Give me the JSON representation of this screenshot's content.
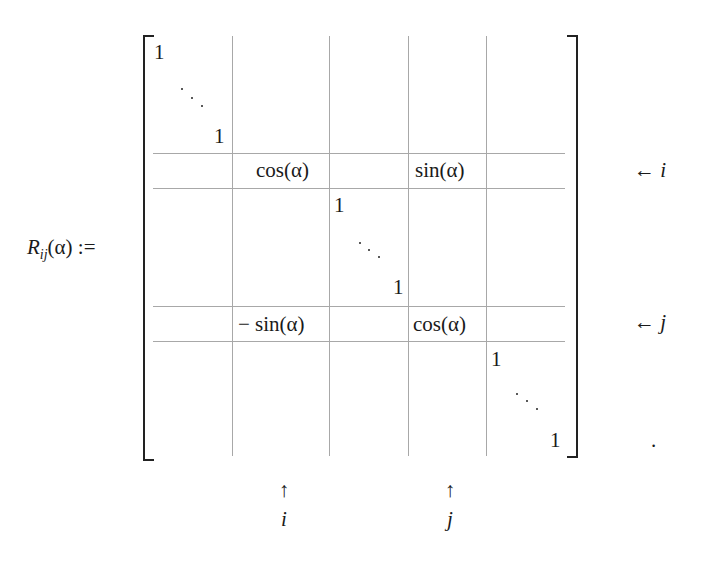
{
  "equation": {
    "lhs": {
      "symbol": "R",
      "subscript": "ij",
      "argument": "(α)",
      "assign": ":="
    },
    "matrix": {
      "entries": {
        "top_one": "1",
        "block1_end_one": "1",
        "cos_ii": "cos(α)",
        "sin_ij": "sin(α)",
        "mid_start_one": "1",
        "mid_end_one": "1",
        "neg_sin_ji": "− sin(α)",
        "cos_jj": "cos(α)",
        "block3_start_one": "1",
        "bottom_one": "1"
      },
      "ellipsis": "⋱"
    },
    "row_labels": [
      {
        "arrow": "←",
        "index": "i"
      },
      {
        "arrow": "←",
        "index": "j"
      }
    ],
    "column_labels": [
      {
        "arrow": "↑",
        "index": "i"
      },
      {
        "arrow": "↑",
        "index": "j"
      }
    ],
    "terminal_punctuation": "."
  },
  "colors": {
    "text": "#1a1a1a",
    "grid_lines": "#a8a8a8",
    "background": "#ffffff"
  }
}
